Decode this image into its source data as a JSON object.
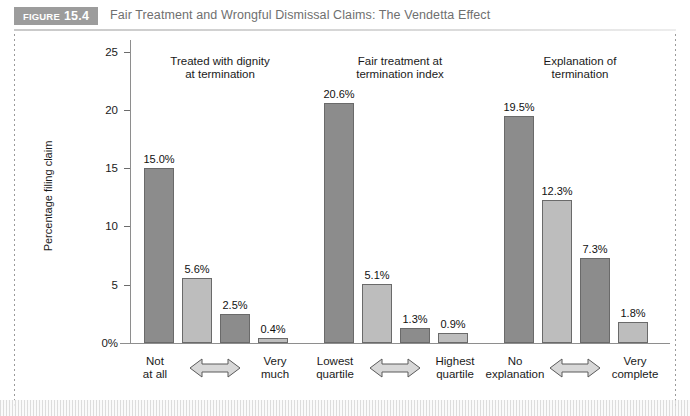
{
  "figure": {
    "badge_word": "FIGURE",
    "badge_number": "15.4",
    "title": "Fair Treatment and Wrongful Dismissal Claims: The Vendetta Effect"
  },
  "colors": {
    "badge_bg": "#9c9c9c",
    "bar_dark": "#8c8c8c",
    "bar_light": "#bdbdbd",
    "axis": "#8e8e8e",
    "title_text": "#6f6f6f"
  },
  "chart_data": {
    "type": "bar",
    "title": "Fair Treatment and Wrongful Dismissal Claims: The Vendetta Effect",
    "xlabel": "",
    "ylabel": "Percentage filing claim",
    "ylim": [
      0,
      26
    ],
    "grid": false,
    "legend": "none",
    "ytick_labels": [
      "0%",
      "5",
      "10",
      "15",
      "20",
      "25"
    ],
    "ytick_values": [
      0,
      5,
      10,
      15,
      20,
      25
    ],
    "groups": [
      {
        "name": "Treated with dignity at termination",
        "title_line1": "Treated with dignity",
        "title_line2": "at termination",
        "axis_left_line1": "Not",
        "axis_left_line2": "at all",
        "axis_right_line1": "Very",
        "axis_right_line2": "much",
        "values": [
          15.0,
          5.6,
          2.5,
          0.4
        ],
        "labels": [
          "15.0%",
          "5.6%",
          "2.5%",
          "0.4%"
        ],
        "shades": [
          "dark",
          "light",
          "dark",
          "light"
        ]
      },
      {
        "name": "Fair treatment at termination index",
        "title_line1": "Fair treatment at",
        "title_line2": "termination index",
        "axis_left_line1": "Lowest",
        "axis_left_line2": "quartile",
        "axis_right_line1": "Highest",
        "axis_right_line2": "quartile",
        "values": [
          20.6,
          5.1,
          1.3,
          0.9
        ],
        "labels": [
          "20.6%",
          "5.1%",
          "1.3%",
          "0.9%"
        ],
        "shades": [
          "dark",
          "light",
          "dark",
          "light"
        ]
      },
      {
        "name": "Explanation of termination",
        "title_line1": "Explanation of",
        "title_line2": "termination",
        "axis_left_line1": "No",
        "axis_left_line2": "explanation",
        "axis_right_line1": "Very",
        "axis_right_line2": "complete",
        "values": [
          19.5,
          12.3,
          7.3,
          1.8
        ],
        "labels": [
          "19.5%",
          "12.3%",
          "7.3%",
          "1.8%"
        ],
        "shades": [
          "dark",
          "light",
          "dark",
          "light"
        ]
      }
    ]
  }
}
